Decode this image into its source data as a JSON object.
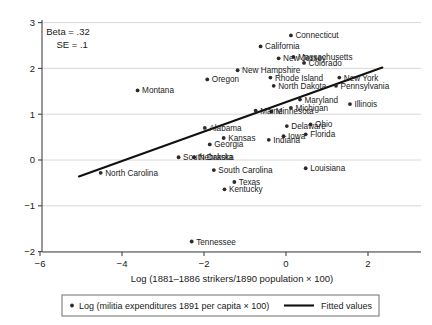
{
  "chart_data": {
    "type": "scatter",
    "title": "",
    "xlabel": "Log (1881–1886 strikers/1890 population × 100)",
    "ylabel": "",
    "xlim": [
      -6.6,
      3.3
    ],
    "ylim": [
      -2.25,
      3.15
    ],
    "xticks": [
      -6,
      -4,
      -2,
      0,
      2
    ],
    "yticks": [
      -2,
      -1,
      0,
      1,
      2,
      3
    ],
    "xtick_labels": [
      "−6",
      "−4",
      "−2",
      "0",
      "2"
    ],
    "ytick_labels": [
      "−2",
      "−1",
      "0",
      "1",
      "2",
      "3"
    ],
    "grid": "horizontal",
    "legend_position": "bottom",
    "annotations": [
      {
        "id": "beta",
        "text": "Beta = .32",
        "x": -5.85,
        "y": 2.72
      },
      {
        "id": "se",
        "text": "SE = .1",
        "x": -5.6,
        "y": 2.44
      }
    ],
    "legend": [
      {
        "id": "points",
        "label": "Log (militia expenditures 1891 per capita × 100)",
        "marker": "dot"
      },
      {
        "id": "fit",
        "label": "Fitted values",
        "marker": "line"
      }
    ],
    "fit_line": {
      "name": "Fitted values",
      "x": [
        -5.05,
        2.35
      ],
      "y": [
        -0.36,
        2.02
      ]
    },
    "series": [
      {
        "name": "Log (militia expenditures 1891 per capita × 100)",
        "points": [
          {
            "label": "Connecticut",
            "x": 0.12,
            "y": 2.72,
            "label_pos": "right"
          },
          {
            "label": "California",
            "x": -0.62,
            "y": 2.48,
            "label_pos": "right"
          },
          {
            "label": "New Jersey",
            "x": -0.18,
            "y": 2.22,
            "label_pos": "right"
          },
          {
            "label": "Massachusetts",
            "x": 0.18,
            "y": 2.25,
            "label_pos": "right"
          },
          {
            "label": "Colorado",
            "x": 0.44,
            "y": 2.12,
            "label_pos": "right"
          },
          {
            "label": "New Hampshire",
            "x": -1.18,
            "y": 1.96,
            "label_pos": "right"
          },
          {
            "label": "Rhode Island",
            "x": -0.38,
            "y": 1.8,
            "label_pos": "right"
          },
          {
            "label": "New York",
            "x": 1.3,
            "y": 1.8,
            "label_pos": "right"
          },
          {
            "label": "Oregon",
            "x": -1.92,
            "y": 1.76,
            "label_pos": "right"
          },
          {
            "label": "North Dakota",
            "x": -0.3,
            "y": 1.62,
            "label_pos": "right"
          },
          {
            "label": "Pennsylvania",
            "x": 1.22,
            "y": 1.62,
            "label_pos": "right"
          },
          {
            "label": "Maryland",
            "x": 0.34,
            "y": 1.32,
            "label_pos": "right"
          },
          {
            "label": "Illinois",
            "x": 1.56,
            "y": 1.22,
            "label_pos": "right"
          },
          {
            "label": "Montana",
            "x": -3.62,
            "y": 1.52,
            "label_pos": "right"
          },
          {
            "label": "Michigan",
            "x": 0.12,
            "y": 1.14,
            "label_pos": "right"
          },
          {
            "label": "Maine",
            "x": -0.74,
            "y": 1.08,
            "label_pos": "right"
          },
          {
            "label": "Minnesota",
            "x": -0.36,
            "y": 1.06,
            "label_pos": "right"
          },
          {
            "label": "Delaware",
            "x": 0.02,
            "y": 0.74,
            "label_pos": "right"
          },
          {
            "label": "Ohio",
            "x": 0.6,
            "y": 0.78,
            "label_pos": "right"
          },
          {
            "label": "Iowa",
            "x": -0.06,
            "y": 0.52,
            "label_pos": "right"
          },
          {
            "label": "Florida",
            "x": 0.48,
            "y": 0.56,
            "label_pos": "right"
          },
          {
            "label": "Indiana",
            "x": -0.42,
            "y": 0.44,
            "label_pos": "right"
          },
          {
            "label": "Alabama",
            "x": -1.98,
            "y": 0.7,
            "label_pos": "right"
          },
          {
            "label": "Kansas",
            "x": -1.52,
            "y": 0.48,
            "label_pos": "right"
          },
          {
            "label": "Georgia",
            "x": -1.86,
            "y": 0.34,
            "label_pos": "right"
          },
          {
            "label": "South Dakota",
            "x": -2.62,
            "y": 0.06,
            "label_pos": "right"
          },
          {
            "label": "Nebraska",
            "x": -2.24,
            "y": 0.06,
            "label_pos": "right"
          },
          {
            "label": "Louisiana",
            "x": 0.48,
            "y": -0.18,
            "label_pos": "right"
          },
          {
            "label": "South Carolina",
            "x": -1.76,
            "y": -0.22,
            "label_pos": "right"
          },
          {
            "label": "North Carolina",
            "x": -4.52,
            "y": -0.28,
            "label_pos": "right"
          },
          {
            "label": "Texas",
            "x": -1.26,
            "y": -0.48,
            "label_pos": "right"
          },
          {
            "label": "Kentucky",
            "x": -1.5,
            "y": -0.64,
            "label_pos": "right"
          },
          {
            "label": "Tennessee",
            "x": -2.3,
            "y": -1.78,
            "label_pos": "right"
          }
        ]
      }
    ]
  }
}
